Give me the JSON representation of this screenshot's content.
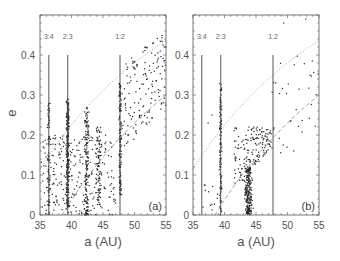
{
  "chart_data": [
    {
      "type": "scatter",
      "panel": "(a)",
      "title": "",
      "xlabel": "a (AU)",
      "ylabel": "e",
      "xlim": [
        35,
        55
      ],
      "ylim": [
        0,
        0.5
      ],
      "xticks": [
        35,
        40,
        45,
        50,
        55
      ],
      "yticks": [
        0,
        0.1,
        0.2,
        0.3,
        0.4
      ],
      "grid": false,
      "resonances": [
        {
          "label": "3:4",
          "a": 36.4,
          "e_top": 0.4
        },
        {
          "label": "2:3",
          "a": 39.4,
          "e_top": 0.4
        },
        {
          "label": "1:2",
          "a": 47.7,
          "e_top": 0.4
        }
      ],
      "curves": [
        {
          "name": "perihelion q=31 AU",
          "style": "dotted",
          "q": 31
        },
        {
          "name": "perihelion q=38.5 AU",
          "style": "dashed",
          "q": 38.5
        }
      ],
      "clusters": [
        {
          "a_center": 36.4,
          "a_spread": 0.35,
          "e_min": 0.0,
          "e_max": 0.28,
          "n": 70
        },
        {
          "a_center": 39.4,
          "a_spread": 0.3,
          "e_min": 0.02,
          "e_max": 0.29,
          "n": 260
        },
        {
          "a_center": 42.4,
          "a_spread": 0.5,
          "e_min": 0.0,
          "e_max": 0.27,
          "n": 140
        },
        {
          "a_center": 44.3,
          "a_spread": 0.7,
          "e_min": 0.02,
          "e_max": 0.22,
          "n": 90
        },
        {
          "a_center": 47.7,
          "a_spread": 0.3,
          "e_min": 0.05,
          "e_max": 0.33,
          "n": 130
        },
        {
          "a_range": [
            35.2,
            47
          ],
          "e_min": 0.0,
          "e_max": 0.2,
          "n": 260
        },
        {
          "a_range": [
            48,
            55
          ],
          "e_band": "between_curves",
          "n": 150
        }
      ],
      "annotation": "(a)"
    },
    {
      "type": "scatter",
      "panel": "(b)",
      "title": "",
      "xlabel": "a (AU)",
      "ylabel": "",
      "xlim": [
        35,
        55
      ],
      "ylim": [
        0,
        0.5
      ],
      "xticks": [
        35,
        40,
        45,
        50,
        55
      ],
      "yticks": [
        0,
        0.1,
        0.2,
        0.3,
        0.4
      ],
      "grid": false,
      "resonances": [
        {
          "label": "3:4",
          "a": 36.4,
          "e_top": 0.4
        },
        {
          "label": "2:3",
          "a": 39.4,
          "e_top": 0.4
        },
        {
          "label": "1:2",
          "a": 47.7,
          "e_top": 0.4
        }
      ],
      "curves": [
        {
          "name": "perihelion q=31 AU",
          "style": "dotted",
          "q": 31
        },
        {
          "name": "perihelion q=38.5 AU",
          "style": "dashed",
          "q": 38.5
        }
      ],
      "clusters": [
        {
          "a_center": 39.4,
          "a_spread": 0.25,
          "e_min": 0.0,
          "e_max": 0.33,
          "n": 110
        },
        {
          "a_center": 43.8,
          "a_spread": 0.9,
          "e_min": 0.0,
          "e_max": 0.12,
          "n": 220
        },
        {
          "a_range": [
            41.5,
            47.5
          ],
          "e_band": "between_q38_and_0.22",
          "n": 160
        },
        {
          "a_range": [
            36.5,
            39
          ],
          "e_min": 0.01,
          "e_max": 0.08,
          "n": 12
        },
        {
          "a_range": [
            47.5,
            55
          ],
          "e_band": "sparse_high",
          "n": 35
        }
      ],
      "sparse_points": [
        [
          37.4,
          0.23
        ],
        [
          38.0,
          0.25
        ],
        [
          49.4,
          0.48
        ],
        [
          52.9,
          0.49
        ],
        [
          51.0,
          0.16
        ]
      ],
      "annotation": "(b)"
    }
  ],
  "panels": {
    "a": {
      "ylabel": "e",
      "xlabel": "a (AU)",
      "panel_label": "(a)",
      "xtick_labels": [
        "35",
        "40",
        "45",
        "50",
        "55"
      ],
      "ytick_labels": [
        "0",
        "0.1",
        "0.2",
        "0.3",
        "0.4"
      ],
      "res_labels": [
        "3:4",
        "2:3",
        "1:2"
      ]
    },
    "b": {
      "xlabel": "a (AU)",
      "panel_label": "(b)",
      "xtick_labels": [
        "35",
        "40",
        "45",
        "50",
        "55"
      ],
      "ytick_labels": [
        "0",
        "0.1",
        "0.2",
        "0.3",
        "0.4"
      ],
      "res_labels": [
        "3:4",
        "2:3",
        "1:2"
      ]
    }
  },
  "colors": {
    "points": "#222222",
    "axes": "#555555",
    "resonance_lines": "#444444",
    "curves": "#888888"
  }
}
